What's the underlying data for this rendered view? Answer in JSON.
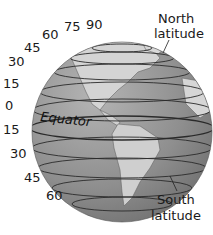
{
  "diagram": {
    "equator_label": "Equator",
    "north_label": [
      "North",
      "latitude"
    ],
    "south_label": [
      "South",
      "latitude"
    ],
    "north_ticks": [
      "0",
      "15",
      "30",
      "45",
      "60",
      "75",
      "90"
    ],
    "south_ticks": [
      "15",
      "30",
      "45",
      "60"
    ],
    "colors": {
      "ocean": "#8c8c8c",
      "land": "#d2d2d2",
      "lines": "#2a2a2a",
      "text": "#1a1a1a"
    }
  }
}
